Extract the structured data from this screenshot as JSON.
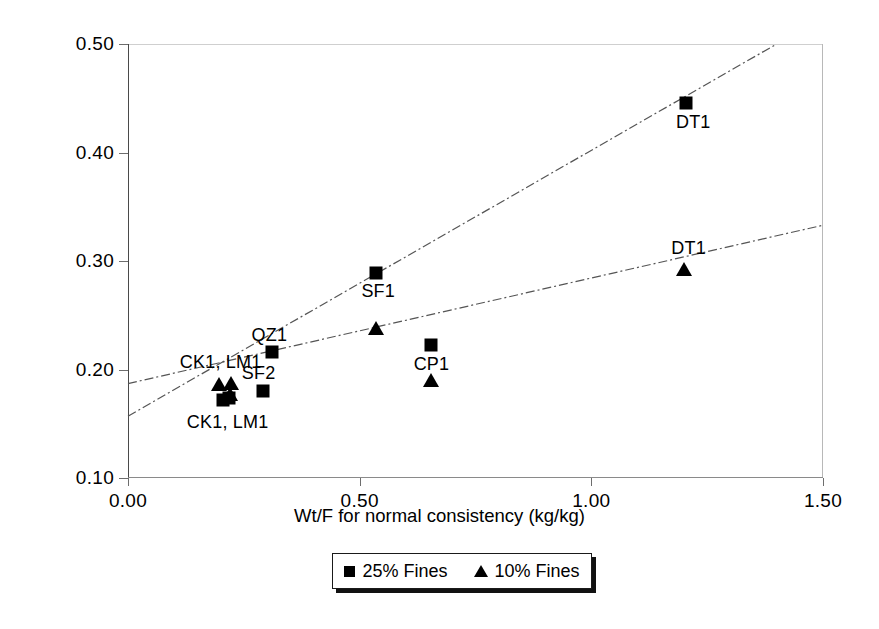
{
  "chart_data": {
    "type": "scatter",
    "title": "",
    "xlabel": "Wt/F for normal consistency (kg/kg)",
    "ylabel": "Wt/(F+C) for normal consistency (kg/kg)",
    "xlim": [
      0.0,
      1.5
    ],
    "ylim": [
      0.1,
      0.5
    ],
    "xticks": [
      "0.00",
      "0.50",
      "1.00",
      "1.50"
    ],
    "xtick_values": [
      0.0,
      0.5,
      1.0,
      1.5
    ],
    "yticks": [
      "0.10",
      "0.20",
      "0.30",
      "0.40",
      "0.50"
    ],
    "ytick_values": [
      0.1,
      0.2,
      0.3,
      0.4,
      0.5
    ],
    "grid": false,
    "legend_position": "below-axes",
    "series": [
      {
        "name": "25% Fines",
        "marker": "square",
        "color": "#000000",
        "points": [
          {
            "label": "CK1, LM1",
            "x": 0.205,
            "y": 0.172
          },
          {
            "label": "CK1, LM1",
            "x": 0.218,
            "y": 0.174
          },
          {
            "label": "SF2",
            "x": 0.292,
            "y": 0.18
          },
          {
            "label": "QZ1",
            "x": 0.31,
            "y": 0.216
          },
          {
            "label": "SF1",
            "x": 0.535,
            "y": 0.289
          },
          {
            "label": "CP1",
            "x": 0.655,
            "y": 0.223
          },
          {
            "label": "DT1",
            "x": 1.205,
            "y": 0.446
          }
        ]
      },
      {
        "name": "10% Fines",
        "marker": "triangle",
        "color": "#000000",
        "points": [
          {
            "label": "CK1, LM1",
            "x": 0.196,
            "y": 0.187
          },
          {
            "label": "CK1, LM1",
            "x": 0.222,
            "y": 0.188
          },
          {
            "label": "CK1, LM1",
            "x": 0.22,
            "y": 0.177
          },
          {
            "label": "SF1",
            "x": 0.535,
            "y": 0.238
          },
          {
            "label": "CP1",
            "x": 0.655,
            "y": 0.19
          },
          {
            "label": "DT1",
            "x": 1.2,
            "y": 0.293
          }
        ]
      }
    ],
    "trendlines": [
      {
        "name": "25% Fines fit",
        "x0": 0.0,
        "y0": 0.157,
        "x1": 1.4,
        "y1": 0.5,
        "style": "dash-dot"
      },
      {
        "name": "10% Fines fit",
        "x0": 0.0,
        "y0": 0.187,
        "x1": 1.5,
        "y1": 0.333,
        "style": "dash-dot"
      }
    ],
    "annotations": [
      {
        "text": "QZ1",
        "x": 0.305,
        "y": 0.232,
        "anchor": "center"
      },
      {
        "text": "CK1, LM1",
        "x": 0.2,
        "y": 0.207,
        "anchor": "center"
      },
      {
        "text": "SF2",
        "x": 0.282,
        "y": 0.197,
        "anchor": "center"
      },
      {
        "text": "CK1, LM1",
        "x": 0.215,
        "y": 0.152,
        "anchor": "center"
      },
      {
        "text": "SF1",
        "x": 0.54,
        "y": 0.272,
        "anchor": "center"
      },
      {
        "text": "CP1",
        "x": 0.655,
        "y": 0.205,
        "anchor": "center"
      },
      {
        "text": "DT1",
        "x": 1.22,
        "y": 0.428,
        "anchor": "center"
      },
      {
        "text": "DT1",
        "x": 1.21,
        "y": 0.312,
        "anchor": "center"
      }
    ]
  },
  "axes": {
    "xlabel": "Wt/F for normal consistency (kg/kg)",
    "ylabel": "Wt/(F+C) for normal consistency (kg/kg)",
    "xticks": [
      "0.00",
      "0.50",
      "1.00",
      "1.50"
    ],
    "yticks": [
      "0.10",
      "0.20",
      "0.30",
      "0.40",
      "0.50"
    ]
  },
  "legend": {
    "entries": [
      {
        "label": "25% Fines",
        "marker": "square"
      },
      {
        "label": "10% Fines",
        "marker": "triangle"
      }
    ]
  }
}
